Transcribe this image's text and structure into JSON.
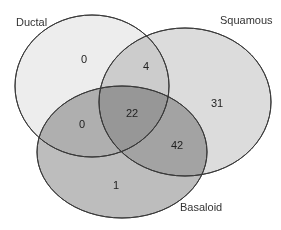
{
  "diagram": {
    "type": "venn",
    "sets": [
      {
        "id": "ductal",
        "label": "Ductal",
        "fill": "#ededed"
      },
      {
        "id": "squamous",
        "label": "Squamous",
        "fill": "#dcdcdc"
      },
      {
        "id": "basaloid",
        "label": "Basaloid",
        "fill": "#bdbdbd"
      }
    ],
    "regions": [
      {
        "id": "ductal_only",
        "sets": [
          "ductal"
        ],
        "value": "0"
      },
      {
        "id": "squamous_only",
        "sets": [
          "squamous"
        ],
        "value": "31"
      },
      {
        "id": "basaloid_only",
        "sets": [
          "basaloid"
        ],
        "value": "1"
      },
      {
        "id": "ductal_squamous",
        "sets": [
          "ductal",
          "squamous"
        ],
        "value": "4"
      },
      {
        "id": "ductal_basaloid",
        "sets": [
          "ductal",
          "basaloid"
        ],
        "value": "0"
      },
      {
        "id": "squamous_basaloid",
        "sets": [
          "squamous",
          "basaloid"
        ],
        "value": "42"
      },
      {
        "id": "all_three",
        "sets": [
          "ductal",
          "squamous",
          "basaloid"
        ],
        "value": "22"
      }
    ],
    "stroke_color": "#3a3a3a"
  }
}
